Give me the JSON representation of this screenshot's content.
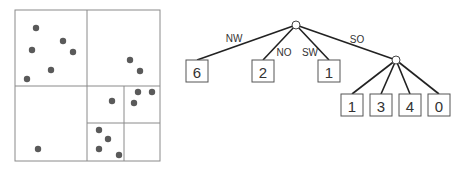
{
  "quadtree": {
    "outer": {
      "x": 15,
      "y": 10,
      "w": 145,
      "h": 151
    },
    "lines": [
      {
        "x1": 87,
        "y1": 10,
        "x2": 87,
        "y2": 161
      },
      {
        "x1": 15,
        "y1": 86,
        "x2": 160,
        "y2": 86
      },
      {
        "x1": 124,
        "y1": 86,
        "x2": 124,
        "y2": 161
      },
      {
        "x1": 87,
        "y1": 123,
        "x2": 160,
        "y2": 123
      }
    ],
    "points": [
      [
        36,
        28
      ],
      [
        63,
        41
      ],
      [
        32,
        50
      ],
      [
        73,
        52
      ],
      [
        51,
        70
      ],
      [
        27,
        79
      ],
      [
        130,
        60
      ],
      [
        140,
        71
      ],
      [
        112,
        101
      ],
      [
        138,
        92
      ],
      [
        152,
        92
      ],
      [
        134,
        103
      ],
      [
        99,
        130
      ],
      [
        108,
        139
      ],
      [
        99,
        149
      ],
      [
        119,
        155
      ],
      [
        38,
        149
      ]
    ]
  },
  "tree": {
    "root": {
      "x": 296,
      "y": 25
    },
    "child_node": {
      "x": 396,
      "y": 60
    },
    "top_leaves": [
      {
        "label": "NW",
        "count": "6",
        "x": 197,
        "y": 71,
        "label_x": 234,
        "label_y": 38
      },
      {
        "label": "NO",
        "count": "2",
        "x": 263,
        "y": 71,
        "label_x": 284,
        "label_y": 52
      },
      {
        "label": "SW",
        "count": "1",
        "x": 329,
        "y": 71,
        "label_x": 310,
        "label_y": 52
      }
    ],
    "so_label": {
      "text": "SO",
      "x": 357,
      "y": 39
    },
    "bottom_leaves": [
      {
        "count": "1",
        "x": 352,
        "y": 105
      },
      {
        "count": "3",
        "x": 381,
        "y": 105
      },
      {
        "count": "4",
        "x": 410,
        "y": 105
      },
      {
        "count": "0",
        "x": 439,
        "y": 105
      }
    ],
    "leaf_size": 22
  }
}
